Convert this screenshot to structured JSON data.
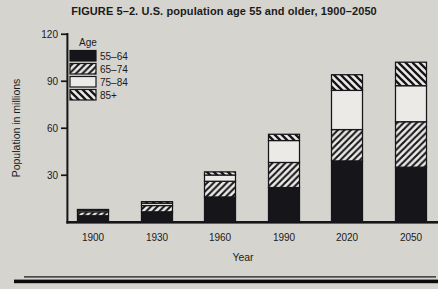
{
  "colors": {
    "background": "#d6d4cf",
    "ink": "#16161a",
    "band_white": "#ebeae6",
    "rule_thin": "#4a4a46"
  },
  "chart_data": {
    "type": "bar",
    "stacked": true,
    "title": "FIGURE 5–2. U.S. population age 55 and older, 1900–2050",
    "xlabel": "Year",
    "ylabel": "Population in millions",
    "ylim": [
      0,
      120
    ],
    "yticks": [
      "30",
      "60",
      "90",
      "120"
    ],
    "grid": false,
    "legend_title": "Age",
    "legend_position": "upper-left-inside",
    "categories": [
      "1900",
      "1930",
      "1960",
      "1990",
      "2020",
      "2050"
    ],
    "series": [
      {
        "name": "55–64",
        "pattern": "solid",
        "values": [
          4.0,
          6.5,
          16.0,
          22.0,
          39.0,
          35.0
        ]
      },
      {
        "name": "65–74",
        "pattern": "hatch-forward",
        "values": [
          2.5,
          4.0,
          10.0,
          16.0,
          20.0,
          29.0
        ]
      },
      {
        "name": "75–84",
        "pattern": "white",
        "values": [
          1.0,
          1.5,
          4.0,
          14.0,
          25.0,
          23.0
        ]
      },
      {
        "name": "85+",
        "pattern": "hatch-back",
        "values": [
          0.5,
          1.0,
          2.0,
          4.0,
          10.0,
          15.0
        ]
      }
    ],
    "totals": [
      8,
      13,
      32,
      56,
      94,
      102
    ]
  }
}
